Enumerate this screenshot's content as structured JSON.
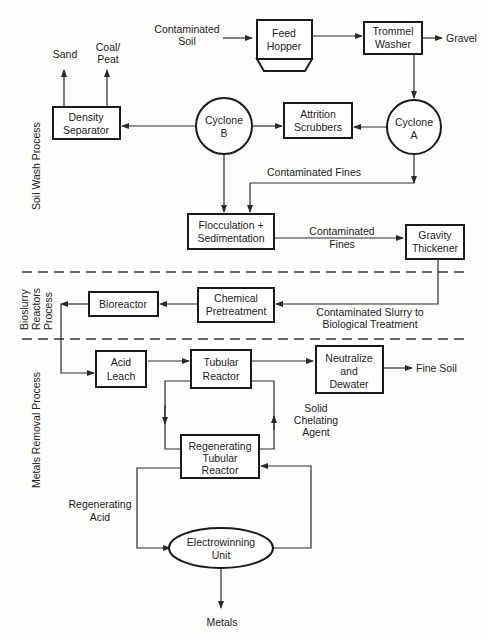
{
  "diagram": {
    "type": "process-flow",
    "sections": [
      {
        "id": "soil-wash",
        "label": "Soil Wash Process"
      },
      {
        "id": "bioslurry",
        "label_lines": [
          "Bioslurry",
          "Reactors",
          "Process"
        ]
      },
      {
        "id": "metals-removal",
        "label": "Metals Removal Process"
      }
    ],
    "nodes": {
      "contaminated_soil": [
        "Contaminated",
        "Soil"
      ],
      "feed_hopper": [
        "Feed",
        "Hopper"
      ],
      "trommel_washer": [
        "Trommel",
        "Washer"
      ],
      "gravel": "Gravel",
      "sand": "Sand",
      "coal_peat": [
        "Coal/",
        "Peat"
      ],
      "density_separator": [
        "Density",
        "Separator"
      ],
      "cyclone_b": [
        "Cyclone",
        "B"
      ],
      "attrition_scrubbers": [
        "Attrition",
        "Scrubbers"
      ],
      "cyclone_a": [
        "Cyclone",
        "A"
      ],
      "contaminated_fines_1": "Contaminated Fines",
      "flocculation": [
        "Flocculation +",
        "Sedimentation"
      ],
      "contaminated_fines_2": [
        "Contaminated",
        "Fines"
      ],
      "gravity_thickener": [
        "Gravity",
        "Thickener"
      ],
      "bioreactor": "Bioreactor",
      "chemical_pretreatment": [
        "Chemical",
        "Pretreatment"
      ],
      "slurry_to_bio": [
        "Contaminated Slurry to",
        "Biological Treatment"
      ],
      "acid_leach": [
        "Acid",
        "Leach"
      ],
      "tubular_reactor": [
        "Tubular",
        "Reactor"
      ],
      "neutralize": [
        "Neutralize",
        "and",
        "Dewater"
      ],
      "fine_soil": "Fine Soil",
      "solid_chelating": [
        "Solid",
        "Chelating",
        "Agent"
      ],
      "regen_tubular": [
        "Regenerating",
        "Tubular",
        "Reactor"
      ],
      "regen_acid": [
        "Regenerating",
        "Acid"
      ],
      "electrowinning": [
        "Electrowinning",
        "Unit"
      ],
      "metals": "Metals"
    },
    "edges": [
      [
        "Contaminated Soil",
        "Feed Hopper"
      ],
      [
        "Feed Hopper",
        "Trommel Washer"
      ],
      [
        "Trommel Washer",
        "Gravel"
      ],
      [
        "Trommel Washer",
        "Cyclone A"
      ],
      [
        "Cyclone A",
        "Attrition Scrubbers"
      ],
      [
        "Cyclone B",
        "Attrition Scrubbers"
      ],
      [
        "Cyclone B",
        "Density Separator"
      ],
      [
        "Density Separator",
        "Sand"
      ],
      [
        "Density Separator",
        "Coal/Peat"
      ],
      [
        "Cyclone B",
        "Flocculation + Sedimentation"
      ],
      [
        "Cyclone A",
        "Flocculation + Sedimentation"
      ],
      [
        "Flocculation + Sedimentation",
        "Gravity Thickener"
      ],
      [
        "Gravity Thickener",
        "Chemical Pretreatment"
      ],
      [
        "Chemical Pretreatment",
        "Bioreactor"
      ],
      [
        "Bioreactor",
        "Acid Leach"
      ],
      [
        "Acid Leach",
        "Tubular Reactor"
      ],
      [
        "Tubular Reactor",
        "Neutralize and Dewater"
      ],
      [
        "Neutralize and Dewater",
        "Fine Soil"
      ],
      [
        "Tubular Reactor",
        "Regenerating Tubular Reactor"
      ],
      [
        "Regenerating Tubular Reactor",
        "Tubular Reactor"
      ],
      [
        "Regenerating Tubular Reactor",
        "Electrowinning Unit"
      ],
      [
        "Electrowinning Unit",
        "Regenerating Tubular Reactor"
      ],
      [
        "Electrowinning Unit",
        "Metals"
      ]
    ]
  },
  "colors": {
    "line": "#2a2a2a",
    "box_fill": "#ffffff",
    "background": "#fdfdfc"
  }
}
